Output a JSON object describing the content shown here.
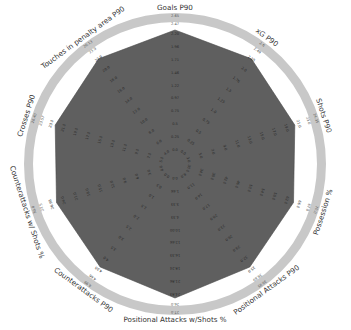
{
  "chart_data": {
    "type": "radar",
    "title": "",
    "axes": [
      {
        "label": "Goals P90",
        "ticks": [
          "0.0",
          "0.25",
          "0.5",
          "0.75",
          "0.97",
          "1.22",
          "1.46",
          "1.71",
          "1.96",
          "2.20",
          "2.47",
          "2.65"
        ]
      },
      {
        "label": "xG P90",
        "ticks": [
          "0.0",
          "0.25",
          "0.5",
          "0.75",
          "1.0",
          "1.25",
          "1.5",
          "1.76",
          "2.0",
          "2.25",
          "2.49",
          "2.6"
        ]
      },
      {
        "label": "Shots P90",
        "ticks": [
          "3.0",
          "5.0",
          "7.0",
          "9.0",
          "11.0",
          "13.0",
          "15.0",
          "17.0",
          "19.0",
          "21.0",
          "23.0",
          "24.35"
        ]
      },
      {
        "label": "Possession %",
        "ticks": [
          "30.0",
          "34.0",
          "38.0",
          "42.0",
          "46.0",
          "50.0",
          "54.0",
          "58.0",
          "62.0",
          "66.0",
          "67.8",
          "70.0"
        ]
      },
      {
        "label": "Positional Attacks P90",
        "ticks": [
          "8.0",
          "11.0",
          "14.0",
          "17.0",
          "20.0",
          "23.0",
          "26.0",
          "29.0",
          "32.0",
          "35.0",
          "38.69",
          "39.95"
        ]
      },
      {
        "label": "Positional Attacks w/Shots %",
        "ticks": [
          "0.0",
          "1.66",
          "3.33",
          "4.33",
          "10.00",
          "12.66",
          "16.33",
          "18.24",
          "21.86",
          "24.83",
          "26.0",
          "27.0"
        ]
      },
      {
        "label": "Counterattacks P90",
        "ticks": [
          "0.0",
          "0.5",
          "1.0",
          "1.5",
          "2.0",
          "2.5",
          "3.0",
          "3.5",
          "4.0",
          "4.55",
          "4.66",
          "4.99"
        ]
      },
      {
        "label": "Counterattacks w/ Shots %",
        "ticks": [
          "0.0",
          "3.0",
          "6.0",
          "9.0",
          "12.0",
          "15.0",
          "18.0",
          "21.0",
          "24.0",
          "26.98",
          "27.5",
          "30.0"
        ]
      },
      {
        "label": "Crosses P90",
        "ticks": [
          "5.0",
          "7.0",
          "9.0",
          "11.0",
          "13.0",
          "15.0",
          "17.0",
          "19.0",
          "21.0",
          "23.0",
          "23.57",
          "26.40"
        ]
      },
      {
        "label": "Touches in penalty area P90",
        "ticks": [
          "4.0",
          "6.0",
          "8.0",
          "10.0",
          "12.0",
          "14.0",
          "16.0",
          "18.0",
          "20.0",
          "22.0",
          "23.9",
          "26.13"
        ]
      }
    ],
    "series": [
      {
        "name": "Team",
        "values_normalized": [
          1.0,
          0.97,
          0.94,
          0.93,
          0.95,
          1.0,
          0.95,
          0.93,
          0.94,
          0.97
        ],
        "color": "#5f5f5f"
      }
    ],
    "range_normalized": [
      0,
      1
    ],
    "grid": false,
    "legend": "none",
    "colors": {
      "polygon": "#5f5f5f",
      "outer_ring": "#c8c8c8",
      "ring_gap": "#ffffff",
      "label": "#333333"
    }
  },
  "labels": {
    "axis_0": "Goals P90",
    "axis_1": "xG P90",
    "axis_2": "Shots P90",
    "axis_3": "Possession %",
    "axis_4": "Positional Attacks P90",
    "axis_5": "Positional Attacks w/Shots %",
    "axis_6": "Counterattacks P90",
    "axis_7": "Counterattacks w/ Shots %",
    "axis_8": "Crosses P90",
    "axis_9": "Touches in penalty area P90"
  }
}
